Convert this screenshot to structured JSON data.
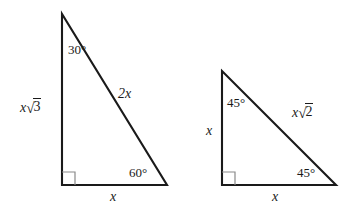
{
  "figure": {
    "background_color": "#ffffff",
    "stroke_color": "#1a1a1a",
    "triangles": [
      {
        "name": "30-60-90 triangle",
        "vertices": {
          "apex": [
            62,
            14
          ],
          "right_angle": [
            62,
            185
          ],
          "base_right": [
            167,
            185
          ]
        },
        "angles": [
          {
            "id": "apex-angle",
            "value": "30°",
            "x": 68,
            "y": 43
          },
          {
            "id": "base-right-angle",
            "value": "60°",
            "x": 129,
            "y": 166
          }
        ],
        "sides": [
          {
            "id": "vertical-leg",
            "coefficient": "x",
            "radical": "3",
            "x": 20,
            "y": 99
          },
          {
            "id": "hypotenuse",
            "plain": "2x",
            "x": 118,
            "y": 87
          },
          {
            "id": "base-leg",
            "plain": "x",
            "x": 110,
            "y": 190
          }
        ],
        "right_angle_marker": {
          "x": 62,
          "y": 185,
          "size": 13
        }
      },
      {
        "name": "45-45-90 triangle",
        "vertices": {
          "apex": [
            222,
            71
          ],
          "right_angle": [
            222,
            185
          ],
          "base_right": [
            336,
            185
          ]
        },
        "angles": [
          {
            "id": "apex-angle",
            "value": "45°",
            "x": 227,
            "y": 96
          },
          {
            "id": "base-right-angle",
            "value": "45°",
            "x": 297,
            "y": 166
          }
        ],
        "sides": [
          {
            "id": "vertical-leg",
            "plain": "x",
            "x": 206,
            "y": 124
          },
          {
            "id": "hypotenuse",
            "coefficient": "x",
            "radical": "2",
            "x": 292,
            "y": 104
          },
          {
            "id": "base-leg",
            "plain": "x",
            "x": 272,
            "y": 190
          }
        ],
        "right_angle_marker": {
          "x": 222,
          "y": 185,
          "size": 13
        }
      }
    ]
  },
  "labels": {
    "t1_angle_apex": "30°",
    "t1_angle_base": "60°",
    "t1_leg_coef": "x",
    "t1_leg_radsign": "√",
    "t1_leg_radicand": "3",
    "t1_hyp": "2x",
    "t1_base": "x",
    "t2_angle_apex": "45°",
    "t2_angle_base": "45°",
    "t2_leg": "x",
    "t2_hyp_coef": "x",
    "t2_hyp_radsign": "√",
    "t2_hyp_radicand": "2",
    "t2_base": "x"
  }
}
